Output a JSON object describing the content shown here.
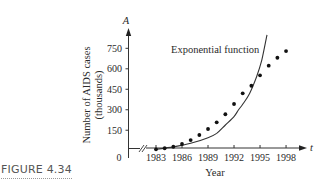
{
  "figure": {
    "label": "FIGURE 4.34"
  },
  "chart_data": {
    "type": "scatter",
    "title": "",
    "xlabel": "Year",
    "ylabel": "Number of AIDS cases",
    "ylabel_line2": "(thousands)",
    "x_axis_variable": "t",
    "y_axis_variable": "A",
    "origin_label": "0",
    "x_ticks": [
      1983,
      1986,
      1989,
      1992,
      1995,
      1998
    ],
    "y_ticks": [
      150,
      300,
      450,
      600,
      750
    ],
    "xlim": [
      1983,
      1999
    ],
    "ylim": [
      0,
      850
    ],
    "x_axis_break": true,
    "grid": false,
    "legend": "none",
    "annotations": [
      {
        "text": "Exponential function",
        "points_to": "curve"
      }
    ],
    "series": [
      {
        "name": "AIDS cases (data)",
        "kind": "scatter",
        "x": [
          1983,
          1984,
          1985,
          1986,
          1987,
          1988,
          1989,
          1990,
          1991,
          1992,
          1993,
          1994,
          1995,
          1996,
          1997,
          1998
        ],
        "values": [
          10,
          18,
          29,
          49,
          78,
          115,
          159,
          208,
          267,
          342,
          420,
          476,
          552,
          623,
          681,
          730
        ]
      },
      {
        "name": "Exponential function",
        "kind": "line",
        "x": [
          1983,
          1985,
          1987,
          1989,
          1990,
          1991,
          1992,
          1992.5,
          1993,
          1993.8,
          1994.6,
          1995.2,
          1995.8
        ],
        "values": [
          10,
          28,
          54,
          95,
          127,
          188,
          250,
          298,
          340,
          420,
          542,
          664,
          848
        ]
      }
    ]
  }
}
